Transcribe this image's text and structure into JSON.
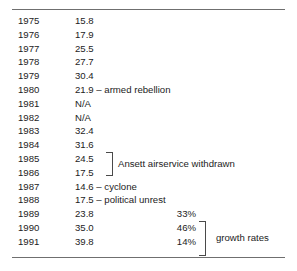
{
  "figure": {
    "type": "table",
    "columns": [
      "year",
      "value",
      "percent"
    ],
    "rows": [
      {
        "year": "1975",
        "value": "15.8",
        "percent": ""
      },
      {
        "year": "1976",
        "value": "17.9",
        "percent": ""
      },
      {
        "year": "1977",
        "value": "25.5",
        "percent": ""
      },
      {
        "year": "1978",
        "value": "27.7",
        "percent": ""
      },
      {
        "year": "1979",
        "value": "30.4",
        "percent": ""
      },
      {
        "year": "1980",
        "value": "21.9 – armed rebellion",
        "percent": ""
      },
      {
        "year": "1981",
        "value": "N/A",
        "percent": ""
      },
      {
        "year": "1982",
        "value": "N/A",
        "percent": ""
      },
      {
        "year": "1983",
        "value": "32.4",
        "percent": ""
      },
      {
        "year": "1984",
        "value": "31.6",
        "percent": ""
      },
      {
        "year": "1985",
        "value": "24.5",
        "percent": ""
      },
      {
        "year": "1986",
        "value": "17.5",
        "percent": ""
      },
      {
        "year": "1987",
        "value": "14.6 – cyclone",
        "percent": ""
      },
      {
        "year": "1988",
        "value": "17.5 – political unrest",
        "percent": ""
      },
      {
        "year": "1989",
        "value": "23.8",
        "percent": "33%"
      },
      {
        "year": "1990",
        "value": "35.0",
        "percent": "46%"
      },
      {
        "year": "1991",
        "value": "39.8",
        "percent": "14%"
      }
    ],
    "annotations": {
      "ansett": "Ansett airservice withdrawn",
      "growth": "growth rates"
    },
    "caption": ""
  },
  "chart_data": {
    "type": "table",
    "title": "",
    "xlabel": "Year",
    "ylabel": "Value",
    "categories": [
      "1975",
      "1976",
      "1977",
      "1978",
      "1979",
      "1980",
      "1981",
      "1982",
      "1983",
      "1984",
      "1985",
      "1986",
      "1987",
      "1988",
      "1989",
      "1990",
      "1991"
    ],
    "values": [
      15.8,
      17.9,
      25.5,
      27.7,
      30.4,
      21.9,
      null,
      null,
      32.4,
      31.6,
      24.5,
      17.5,
      14.6,
      17.5,
      23.8,
      35.0,
      39.8
    ],
    "growth_rates": {
      "1989": "33%",
      "1990": "46%",
      "1991": "14%"
    },
    "event_notes": {
      "1980": "armed rebellion",
      "1985-1986": "Ansett airservice withdrawn",
      "1987": "cyclone",
      "1988": "political unrest"
    },
    "missing_label": "N/A",
    "grid": false,
    "legend": "none"
  }
}
